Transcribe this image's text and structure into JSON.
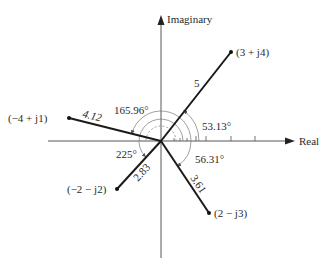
{
  "diagram": {
    "axes": {
      "real_label": "Real",
      "imaginary_label": "Imaginary"
    },
    "vectors": [
      {
        "label": "(3 + j4)",
        "magnitude": "5",
        "angle": "53.13°",
        "re": 3,
        "im": 4
      },
      {
        "label": "(−4 + j1)",
        "magnitude": "4.12",
        "angle": "165.96°",
        "re": -4,
        "im": 1
      },
      {
        "label": "(−2 − j2)",
        "magnitude": "2.83",
        "angle": "225°",
        "re": -2,
        "im": -2
      },
      {
        "label": "(2 − j3)",
        "magnitude": "3.61",
        "angle": "56.31°",
        "re": 2,
        "im": -3
      }
    ],
    "colors": {
      "vector": "#1a1a1a",
      "axis": "#444444",
      "arc": "#666666",
      "background": "#ffffff"
    }
  }
}
